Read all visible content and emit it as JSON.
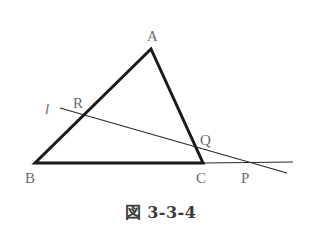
{
  "figure": {
    "caption": "図 3-3-4",
    "colors": {
      "triangle_stroke": "#1a1a1a",
      "line_stroke": "#2a2a2a",
      "label_color": "#6a6a6a"
    },
    "points": {
      "A": {
        "label": "A",
        "x": 151,
        "y": 49
      },
      "B": {
        "label": "B",
        "x": 35,
        "y": 163
      },
      "C": {
        "label": "C",
        "x": 203,
        "y": 163
      },
      "P": {
        "label": "P",
        "x": 253,
        "y": 162
      },
      "Q": {
        "label": "Q",
        "x": 196,
        "y": 148
      },
      "R": {
        "label": "R",
        "x": 84,
        "y": 116
      }
    },
    "line_l": {
      "label": "l",
      "from": {
        "x": 60,
        "y": 108
      },
      "to": {
        "x": 287,
        "y": 173
      }
    },
    "bc_extension": {
      "from": {
        "x": 203,
        "y": 163
      },
      "to": {
        "x": 293,
        "y": 162
      }
    }
  }
}
